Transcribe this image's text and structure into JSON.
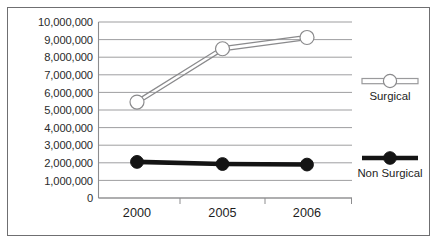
{
  "chart_data": {
    "type": "line",
    "title": "",
    "subtitle": "",
    "xlabel": "",
    "ylabel": "",
    "categories": [
      "2000",
      "2005",
      "2006"
    ],
    "x_tick_labels": [
      "2000",
      "2005",
      "2006"
    ],
    "y_tick_labels": [
      "10,000,000",
      "9,000,000",
      "8,000,000",
      "7,000,000",
      "6,000,000",
      "5,000,000",
      "4,000,000",
      "3,000,000",
      "2,000,000",
      "1,000,000",
      "0"
    ],
    "y_tick_values": [
      10000000,
      9000000,
      8000000,
      7000000,
      6000000,
      5000000,
      4000000,
      3000000,
      2000000,
      1000000,
      0
    ],
    "ylim": [
      0,
      10000000
    ],
    "grid": true,
    "legend_position": "right",
    "series": [
      {
        "name": "Surgical",
        "marker": "open-circle",
        "color": "#8a8a8c",
        "values": [
          5450000,
          8480000,
          9120000
        ]
      },
      {
        "name": "Non Surgical",
        "marker": "filled-circle",
        "color": "#141414",
        "values": [
          2050000,
          1930000,
          1900000
        ]
      }
    ]
  },
  "legend": {
    "items": [
      {
        "label": "Surgical"
      },
      {
        "label": "Non Surgical"
      }
    ]
  },
  "colors": {
    "frame_border": "#6f6f71",
    "gridline": "#8d8d8f",
    "surgical": "#8a8a8c",
    "non_surgical": "#141414",
    "background": "#ffffff"
  }
}
